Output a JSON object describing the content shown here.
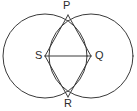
{
  "figure": {
    "background_color": "#ffffff",
    "stroke_color": "#3a3a3a",
    "label_color": "#2b2b2b",
    "stroke_width": 1.0,
    "width": 137,
    "height": 111
  },
  "labels": {
    "p": "P",
    "s": "S",
    "q": "Q",
    "r": "R"
  },
  "geometry": {
    "circles": [
      {
        "name": "left-circle",
        "cx": 45,
        "cy": 56,
        "r": 42
      },
      {
        "name": "right-circle",
        "cx": 91,
        "cy": 56,
        "r": 42
      }
    ],
    "points": [
      {
        "name": "P",
        "x": 68,
        "y": 15
      },
      {
        "name": "S",
        "x": 45,
        "y": 56
      },
      {
        "name": "Q",
        "x": 91,
        "y": 56
      },
      {
        "name": "R",
        "x": 68,
        "y": 97
      }
    ],
    "segments": [
      {
        "name": "PS",
        "x1": 68,
        "y1": 15,
        "x2": 45,
        "y2": 56
      },
      {
        "name": "PQ",
        "x1": 68,
        "y1": 15,
        "x2": 91,
        "y2": 56
      },
      {
        "name": "SR",
        "x1": 45,
        "y1": 56,
        "x2": 68,
        "y2": 97
      },
      {
        "name": "QR",
        "x1": 91,
        "y1": 56,
        "x2": 68,
        "y2": 97
      },
      {
        "name": "SQ",
        "x1": 45,
        "y1": 56,
        "x2": 91,
        "y2": 56
      }
    ]
  }
}
